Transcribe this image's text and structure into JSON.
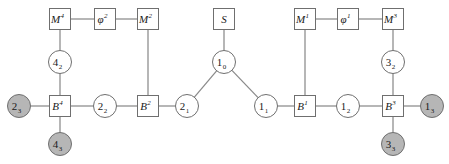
{
  "diagram": {
    "type": "graph-diagram",
    "title": "",
    "colors": {
      "edge": "#8a8a8a",
      "node_stroke": "#6f6f6f",
      "node_fill_plain": "#ffffff",
      "node_fill_shaded": "#b6b6b6",
      "label_color": "#1a1a1a",
      "background": "#ffffff"
    },
    "nodes": [
      {
        "id": "M4",
        "shape": "square",
        "fill": "plain",
        "base": "M",
        "sup": "4",
        "sub": "",
        "x": 60,
        "y": 19
      },
      {
        "id": "phi2",
        "shape": "square",
        "fill": "plain",
        "base": "φ",
        "sup": "2",
        "sub": "",
        "x": 105,
        "y": 19
      },
      {
        "id": "M2",
        "shape": "square",
        "fill": "plain",
        "base": "M",
        "sup": "2",
        "sub": "",
        "x": 148,
        "y": 19
      },
      {
        "id": "S",
        "shape": "square",
        "fill": "plain",
        "base": "S",
        "sup": "",
        "sub": "",
        "x": 224,
        "y": 19
      },
      {
        "id": "M1",
        "shape": "square",
        "fill": "plain",
        "base": "M",
        "sup": "1",
        "sub": "",
        "x": 305,
        "y": 19
      },
      {
        "id": "phi1",
        "shape": "square",
        "fill": "plain",
        "base": "φ",
        "sup": "1",
        "sub": "",
        "x": 348,
        "y": 19
      },
      {
        "id": "M3",
        "shape": "square",
        "fill": "plain",
        "base": "M",
        "sup": "3",
        "sub": "",
        "x": 393,
        "y": 19
      },
      {
        "id": "42",
        "shape": "circle",
        "fill": "plain",
        "base": "4",
        "sup": "",
        "sub": "2",
        "x": 60,
        "y": 62
      },
      {
        "id": "10",
        "shape": "circle",
        "fill": "plain",
        "base": "1",
        "sup": "",
        "sub": "0",
        "x": 224,
        "y": 62
      },
      {
        "id": "32",
        "shape": "circle",
        "fill": "plain",
        "base": "3",
        "sup": "",
        "sub": "2",
        "x": 393,
        "y": 62
      },
      {
        "id": "23",
        "shape": "circle",
        "fill": "shaded",
        "base": "2",
        "sup": "",
        "sub": "3",
        "x": 19,
        "y": 106
      },
      {
        "id": "B4",
        "shape": "square",
        "fill": "plain",
        "base": "B",
        "sup": "4",
        "sub": "",
        "x": 60,
        "y": 106
      },
      {
        "id": "22",
        "shape": "circle",
        "fill": "plain",
        "base": "2",
        "sup": "",
        "sub": "2",
        "x": 105,
        "y": 106
      },
      {
        "id": "B2",
        "shape": "square",
        "fill": "plain",
        "base": "B",
        "sup": "2",
        "sub": "",
        "x": 148,
        "y": 106
      },
      {
        "id": "21",
        "shape": "circle",
        "fill": "plain",
        "base": "2",
        "sup": "",
        "sub": "1",
        "x": 187,
        "y": 106
      },
      {
        "id": "11",
        "shape": "circle",
        "fill": "plain",
        "base": "1",
        "sup": "",
        "sub": "1",
        "x": 266,
        "y": 106
      },
      {
        "id": "B1",
        "shape": "square",
        "fill": "plain",
        "base": "B",
        "sup": "1",
        "sub": "",
        "x": 305,
        "y": 106
      },
      {
        "id": "12",
        "shape": "circle",
        "fill": "plain",
        "base": "1",
        "sup": "",
        "sub": "2",
        "x": 348,
        "y": 106
      },
      {
        "id": "B3",
        "shape": "square",
        "fill": "plain",
        "base": "B",
        "sup": "3",
        "sub": "",
        "x": 393,
        "y": 106
      },
      {
        "id": "13",
        "shape": "circle",
        "fill": "shaded",
        "base": "1",
        "sup": "",
        "sub": "3",
        "x": 432,
        "y": 106
      },
      {
        "id": "43",
        "shape": "circle",
        "fill": "shaded",
        "base": "4",
        "sup": "",
        "sub": "3",
        "x": 60,
        "y": 144
      },
      {
        "id": "33",
        "shape": "circle",
        "fill": "shaded",
        "base": "3",
        "sup": "",
        "sub": "3",
        "x": 393,
        "y": 144
      }
    ],
    "edges": [
      {
        "from": "M4",
        "to": "phi2"
      },
      {
        "from": "phi2",
        "to": "M2"
      },
      {
        "from": "M4",
        "to": "42"
      },
      {
        "from": "42",
        "to": "B4"
      },
      {
        "from": "M2",
        "to": "B2"
      },
      {
        "from": "23",
        "to": "B4"
      },
      {
        "from": "B4",
        "to": "22"
      },
      {
        "from": "22",
        "to": "B2"
      },
      {
        "from": "B2",
        "to": "21"
      },
      {
        "from": "B4",
        "to": "43"
      },
      {
        "from": "S",
        "to": "10"
      },
      {
        "from": "10",
        "to": "21"
      },
      {
        "from": "10",
        "to": "11"
      },
      {
        "from": "11",
        "to": "B1"
      },
      {
        "from": "M1",
        "to": "phi1"
      },
      {
        "from": "phi1",
        "to": "M3"
      },
      {
        "from": "M1",
        "to": "B1"
      },
      {
        "from": "M3",
        "to": "32"
      },
      {
        "from": "32",
        "to": "B3"
      },
      {
        "from": "B1",
        "to": "12"
      },
      {
        "from": "12",
        "to": "B3"
      },
      {
        "from": "B3",
        "to": "13"
      },
      {
        "from": "B3",
        "to": "33"
      }
    ],
    "geometry": {
      "circle_radius": 11.5,
      "square_half": 10.5
    }
  }
}
